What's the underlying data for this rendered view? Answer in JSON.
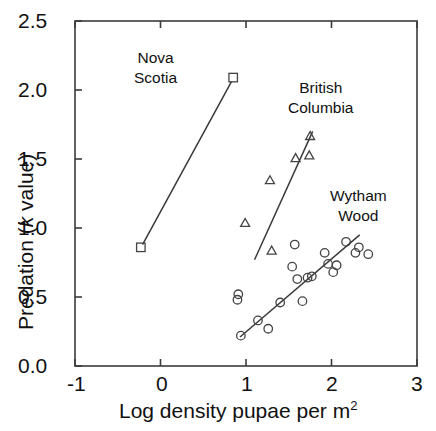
{
  "chart_data": {
    "type": "scatter",
    "title": "",
    "xlabel": "Log density pupae per m2",
    "ylabel": "Predation (k value)",
    "xlim": [
      -1,
      3
    ],
    "ylim": [
      0,
      2.5
    ],
    "xticks": [
      "-1",
      "0",
      "1",
      "2",
      "3"
    ],
    "yticks": [
      "0.0",
      "0.5",
      "1.0",
      "1.5",
      "2.0",
      "2.5"
    ],
    "grid": false,
    "legend_position": "inline-annotations",
    "series": [
      {
        "name": "Nova Scotia",
        "marker": "square-open",
        "trendline": true,
        "points": [
          {
            "x": -0.23,
            "y": 0.86
          },
          {
            "x": 0.85,
            "y": 2.09
          }
        ],
        "trendline_endpoints": [
          {
            "x": -0.21,
            "y": 0.88
          },
          {
            "x": 0.83,
            "y": 2.06
          }
        ]
      },
      {
        "name": "British Columbia",
        "marker": "triangle-open",
        "trendline": true,
        "points": [
          {
            "x": 0.99,
            "y": 1.04
          },
          {
            "x": 1.3,
            "y": 0.84
          },
          {
            "x": 1.28,
            "y": 1.35
          },
          {
            "x": 1.58,
            "y": 1.51
          },
          {
            "x": 1.74,
            "y": 1.53
          },
          {
            "x": 1.75,
            "y": 1.67
          }
        ],
        "trendline_endpoints": [
          {
            "x": 1.1,
            "y": 0.77
          },
          {
            "x": 1.78,
            "y": 1.7
          }
        ]
      },
      {
        "name": "Wytham Wood",
        "marker": "circle-open",
        "trendline": true,
        "points": [
          {
            "x": 0.9,
            "y": 0.48
          },
          {
            "x": 0.91,
            "y": 0.52
          },
          {
            "x": 0.94,
            "y": 0.22
          },
          {
            "x": 1.14,
            "y": 0.33
          },
          {
            "x": 1.26,
            "y": 0.27
          },
          {
            "x": 1.4,
            "y": 0.46
          },
          {
            "x": 1.54,
            "y": 0.72
          },
          {
            "x": 1.57,
            "y": 0.88
          },
          {
            "x": 1.6,
            "y": 0.63
          },
          {
            "x": 1.66,
            "y": 0.47
          },
          {
            "x": 1.72,
            "y": 0.64
          },
          {
            "x": 1.77,
            "y": 0.65
          },
          {
            "x": 1.92,
            "y": 0.82
          },
          {
            "x": 1.96,
            "y": 0.74
          },
          {
            "x": 2.02,
            "y": 0.68
          },
          {
            "x": 2.06,
            "y": 0.73
          },
          {
            "x": 2.17,
            "y": 0.9
          },
          {
            "x": 2.28,
            "y": 0.82
          },
          {
            "x": 2.32,
            "y": 0.86
          },
          {
            "x": 2.43,
            "y": 0.81
          }
        ],
        "trendline_endpoints": [
          {
            "x": 0.93,
            "y": 0.21
          },
          {
            "x": 2.33,
            "y": 0.95
          }
        ]
      }
    ],
    "annotations": [
      {
        "name": "Nova Scotia",
        "lines": [
          "Nova",
          "Scotia"
        ],
        "x_px": 134,
        "y_px": 48
      },
      {
        "name": "British Columbia",
        "lines": [
          "British",
          "Columbia"
        ],
        "x_px": 288,
        "y_px": 78
      },
      {
        "name": "Wytham Wood",
        "lines": [
          "Wytham",
          "Wood"
        ],
        "x_px": 330,
        "y_px": 186
      }
    ]
  },
  "axis": {
    "xlabel_prefix": "Log density pupae per m",
    "xlabel_sup": "2",
    "ylabel_pre": "Predation (",
    "ylabel_ital": "k",
    "ylabel_post": " value)"
  },
  "style": {
    "axis_color": "#3b3b3b",
    "marker_color": "#444444",
    "line_color": "#3a3a3a",
    "text_color": "#111111"
  }
}
